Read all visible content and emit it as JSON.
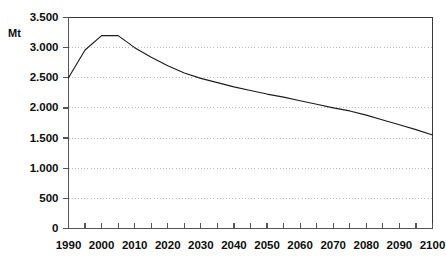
{
  "chart_data": {
    "type": "line",
    "title": "",
    "subtitle": "",
    "xlabel": "",
    "ylabel": "Mt",
    "unit_label": "Mt",
    "xlim": [
      1990,
      2100
    ],
    "ylim": [
      0,
      3500
    ],
    "grid": true,
    "legend": false,
    "legend_position": "none",
    "number_format": "european-thousands-separator-period",
    "x": [
      1990,
      1995,
      2000,
      2005,
      2010,
      2015,
      2020,
      2025,
      2030,
      2035,
      2040,
      2045,
      2050,
      2055,
      2060,
      2065,
      2070,
      2075,
      2080,
      2085,
      2090,
      2095,
      2100
    ],
    "series": [
      {
        "name": "Emissions",
        "values": [
          2500,
          2960,
          3200,
          3200,
          3000,
          2840,
          2700,
          2580,
          2490,
          2420,
          2350,
          2290,
          2230,
          2180,
          2120,
          2060,
          2000,
          1950,
          1880,
          1800,
          1720,
          1640,
          1550
        ]
      }
    ],
    "y_ticks": [
      0,
      500,
      1000,
      1500,
      2000,
      2500,
      3000,
      3500
    ],
    "y_tick_labels": [
      "0",
      "500",
      "1.000",
      "1.500",
      "2.000",
      "2.500",
      "3.000",
      "3.500"
    ],
    "x_ticks": [
      1990,
      1995,
      2000,
      2005,
      2010,
      2015,
      2020,
      2025,
      2030,
      2035,
      2040,
      2045,
      2050,
      2055,
      2060,
      2065,
      2070,
      2075,
      2080,
      2085,
      2090,
      2095,
      2100
    ],
    "x_tick_labels": [
      "1990",
      "2000",
      "2010",
      "2020",
      "2030",
      "2040",
      "2050",
      "2060",
      "2070",
      "2080",
      "2090",
      "2100"
    ],
    "x_tick_label_values": [
      1990,
      2000,
      2010,
      2020,
      2030,
      2040,
      2050,
      2060,
      2070,
      2080,
      2090,
      2100
    ],
    "colors": {
      "series_line": "#1c1c1c",
      "gridline": "#b4b4b4",
      "axis": "#555555",
      "frame": "#3a3a3a",
      "text": "#0d0d0d",
      "background": "#ffffff"
    }
  }
}
